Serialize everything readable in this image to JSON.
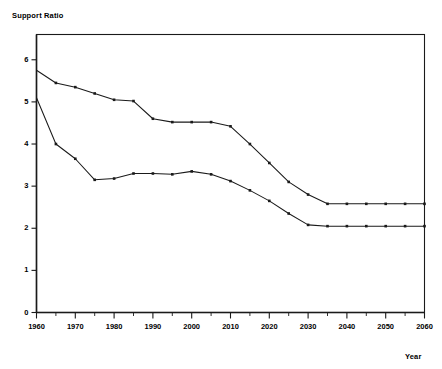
{
  "chart_data": {
    "type": "line",
    "title": "",
    "ylabel": "Support Ratio",
    "xlabel": "Year",
    "xlim": [
      1960,
      2060
    ],
    "ylim": [
      0,
      6.6
    ],
    "grid": false,
    "legend_position": "inline-annotations",
    "y_ticks": [
      "0",
      "1",
      "2",
      "3",
      "4",
      "5",
      "6"
    ],
    "y_tick_values": [
      0,
      1,
      2,
      3,
      4,
      5,
      6
    ],
    "x_ticks": [
      "1960",
      "1970",
      "1980",
      "1990",
      "2000",
      "2010",
      "2020",
      "2030",
      "2040",
      "2050",
      "2060"
    ],
    "x_tick_values": [
      1960,
      1970,
      1980,
      1990,
      2000,
      2010,
      2020,
      2030,
      2040,
      2050,
      2060
    ],
    "x_minor_tick_values": [
      1965,
      1975,
      1985,
      1995,
      2005,
      2015,
      2025,
      2035,
      2045,
      2055
    ],
    "x": [
      1960,
      1965,
      1970,
      1975,
      1980,
      1985,
      1990,
      1995,
      2000,
      2005,
      2010,
      2015,
      2020,
      2025,
      2030,
      2035,
      2040,
      2045,
      2050,
      2055,
      2060
    ],
    "series": [
      {
        "name": "20 to 64/ 65 and over",
        "label_text": "20 to 64/ 65 and over",
        "marker": "square",
        "color": "#1a1a1a",
        "values": [
          5.75,
          5.45,
          5.35,
          5.2,
          5.05,
          5.02,
          4.6,
          4.52,
          4.52,
          4.52,
          4.42,
          4.0,
          3.55,
          3.1,
          2.8,
          2.58,
          2.58,
          2.58,
          2.58,
          2.58,
          2.58
        ]
      },
      {
        "name": "Workers/Beneficiaries",
        "label_text": "Workers/Beneficiaries",
        "marker": "square",
        "color": "#1a1a1a",
        "values": [
          5.1,
          4.0,
          3.65,
          3.15,
          3.18,
          3.3,
          3.3,
          3.28,
          3.35,
          3.28,
          3.12,
          2.9,
          2.65,
          2.35,
          2.08,
          2.05,
          2.05,
          2.05,
          2.05,
          2.05,
          2.05
        ]
      }
    ],
    "annotations": [
      {
        "text": "20 to 64/ 65 and over",
        "series": "20 to 64/ 65 and over"
      },
      {
        "text": "Workers/Beneficiaries",
        "series": "Workers/Beneficiaries"
      }
    ]
  }
}
